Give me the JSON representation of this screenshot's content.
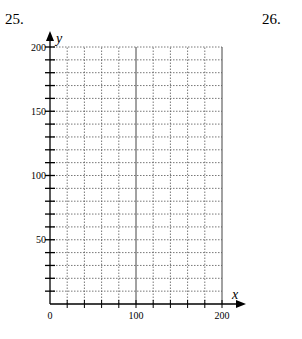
{
  "problems": [
    {
      "number": "25."
    },
    {
      "number": "26."
    }
  ],
  "chart_data": {
    "type": "scatter",
    "title": "",
    "xlabel": "x",
    "ylabel": "y",
    "xlim": [
      0,
      200
    ],
    "ylim": [
      0,
      200
    ],
    "x_major_ticks": [
      0,
      100,
      200
    ],
    "y_major_ticks": [
      50,
      100,
      150,
      200
    ],
    "x_tick_labels": [
      "0",
      "100",
      "200"
    ],
    "y_tick_labels": [
      "50",
      "100",
      "150",
      "200"
    ],
    "x_grid_step": 20,
    "y_grid_step": 10,
    "grid": true,
    "grid_style": "dotted",
    "series": []
  }
}
